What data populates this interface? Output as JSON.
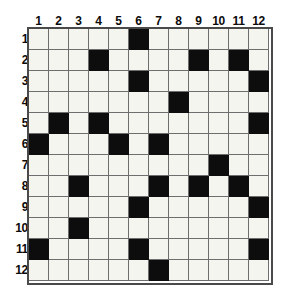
{
  "puzzle": {
    "title": "12x12 filled-cell grid",
    "type": "grid-pattern",
    "rows": 12,
    "columns": 12,
    "column_headers": [
      "1",
      "2",
      "3",
      "4",
      "5",
      "6",
      "7",
      "8",
      "9",
      "10",
      "11",
      "12"
    ],
    "row_headers": [
      "1",
      "2",
      "3",
      "4",
      "5",
      "6",
      "7",
      "8",
      "9",
      "10",
      "11",
      "12"
    ],
    "colors": {
      "filled": "#0d0d0d",
      "empty": "#f5f5f0",
      "gridline": "#6e6e6e",
      "frame": "#4a4a4a",
      "label": "#0b0b0b",
      "background": "#ffffff"
    },
    "filled_cells_by_row": {
      "1": [
        6
      ],
      "2": [
        4,
        9,
        11
      ],
      "3": [
        6,
        12
      ],
      "4": [
        8
      ],
      "5": [
        2,
        4,
        12
      ],
      "6": [
        1,
        5,
        7
      ],
      "7": [
        10
      ],
      "8": [
        3,
        7,
        9,
        11
      ],
      "9": [
        6,
        12
      ],
      "10": [
        3
      ],
      "11": [
        1,
        6,
        12
      ],
      "12": [
        7
      ]
    },
    "filled_count": 24,
    "matrix": [
      [
        0,
        0,
        0,
        0,
        0,
        1,
        0,
        0,
        0,
        0,
        0,
        0
      ],
      [
        0,
        0,
        0,
        1,
        0,
        0,
        0,
        0,
        1,
        0,
        1,
        0
      ],
      [
        0,
        0,
        0,
        0,
        0,
        1,
        0,
        0,
        0,
        0,
        0,
        1
      ],
      [
        0,
        0,
        0,
        0,
        0,
        0,
        0,
        1,
        0,
        0,
        0,
        0
      ],
      [
        0,
        1,
        0,
        1,
        0,
        0,
        0,
        0,
        0,
        0,
        0,
        1
      ],
      [
        1,
        0,
        0,
        0,
        1,
        0,
        1,
        0,
        0,
        0,
        0,
        0
      ],
      [
        0,
        0,
        0,
        0,
        0,
        0,
        0,
        0,
        0,
        1,
        0,
        0
      ],
      [
        0,
        0,
        1,
        0,
        0,
        0,
        1,
        0,
        1,
        0,
        1,
        0
      ],
      [
        0,
        0,
        0,
        0,
        0,
        1,
        0,
        0,
        0,
        0,
        0,
        1
      ],
      [
        0,
        0,
        1,
        0,
        0,
        0,
        0,
        0,
        0,
        0,
        0,
        0
      ],
      [
        1,
        0,
        0,
        0,
        0,
        1,
        0,
        0,
        0,
        0,
        0,
        1
      ],
      [
        0,
        0,
        0,
        0,
        0,
        0,
        1,
        0,
        0,
        0,
        0,
        0
      ]
    ]
  }
}
